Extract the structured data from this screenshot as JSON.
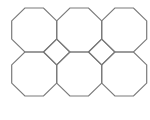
{
  "diagram": {
    "type": "truncated-square-tiling",
    "stroke_color": "#7a7a7a",
    "stroke_width": 1.2,
    "background": "#ffffff",
    "grid": {
      "origin_x": 11.7,
      "origin_y": 8,
      "cell_width": 45,
      "cell_height": 44,
      "columns": 3,
      "rows": 2
    },
    "octagons": [
      {
        "id": "octagon-r1-c1",
        "col": 0,
        "row": 0
      },
      {
        "id": "octagon-r1-c2",
        "col": 1,
        "row": 0
      },
      {
        "id": "octagon-r1-c3",
        "col": 2,
        "row": 0
      },
      {
        "id": "octagon-r2-c1",
        "col": 0,
        "row": 1
      },
      {
        "id": "octagon-r2-c2",
        "col": 1,
        "row": 1
      },
      {
        "id": "octagon-r2-c3",
        "col": 2,
        "row": 1
      }
    ],
    "squares": [
      {
        "id": "square-1",
        "between_cols": [
          0,
          1
        ]
      },
      {
        "id": "square-2",
        "between_cols": [
          1,
          2
        ]
      }
    ]
  }
}
